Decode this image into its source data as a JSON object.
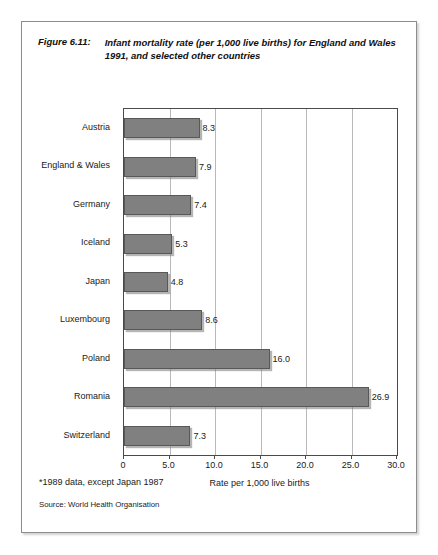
{
  "figure": {
    "number_label": "Figure 6.11:",
    "caption": "Infant mortality rate (per 1,000 live births) for England and Wales 1991, and selected other countries",
    "footnote": "*1989 data, except Japan 1987",
    "source": "Source: World Health Organisation"
  },
  "chart_data": {
    "type": "bar",
    "orientation": "horizontal",
    "title": "Infant mortality rate (per 1,000 live births) for England and Wales 1991, and selected other countries",
    "categories": [
      "Austria",
      "England & Wales",
      "Germany",
      "Iceland",
      "Japan",
      "Luxembourg",
      "Poland",
      "Romania",
      "Switzerland"
    ],
    "values": [
      8.3,
      7.9,
      7.4,
      5.3,
      4.8,
      8.6,
      16.0,
      26.9,
      7.3
    ],
    "value_labels": [
      "8.3",
      "7.9",
      "7.4",
      "5.3",
      "4.8",
      "8.6",
      "16.0",
      "26.9",
      "7.3"
    ],
    "xlabel": "Rate per 1,000 live births",
    "ylabel": "",
    "xlim": [
      0,
      30
    ],
    "xticks": [
      0,
      5,
      10,
      15,
      20,
      25,
      30
    ],
    "xtick_labels": [
      "0",
      "5.0",
      "10.0",
      "15.0",
      "20.0",
      "25.0",
      "30.0"
    ],
    "grid": "vertical",
    "legend": "none",
    "bar_color": "#808080",
    "bar_edge_color": "#585858",
    "gridline_color": "#b9b9b9",
    "axis_color": "#4a4a4a"
  }
}
